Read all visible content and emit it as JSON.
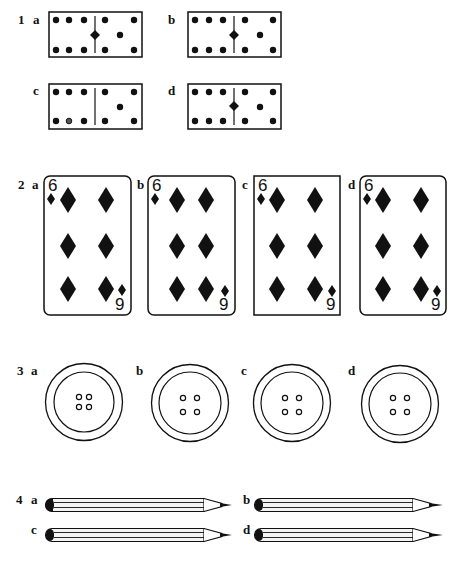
{
  "page": {
    "type": "spot-the-odd-one-out exercise",
    "colors": {
      "ink": "#111111",
      "paper": "#ffffff",
      "pencil_body": "#f4f4f4"
    }
  },
  "questions": [
    {
      "number": "1",
      "subject": "dominoes",
      "options": [
        {
          "letter": "a",
          "left_pips": 6,
          "right_pips": 5,
          "center_diamond": true,
          "note": ""
        },
        {
          "letter": "b",
          "left_pips": 6,
          "right_pips": 5,
          "center_diamond": true,
          "note": ""
        },
        {
          "letter": "c",
          "left_pips": 6,
          "right_pips": 5,
          "center_diamond": false,
          "note": "one hollow-ish pip bottom-middle"
        },
        {
          "letter": "d",
          "left_pips": 6,
          "right_pips": 5,
          "center_diamond": true,
          "note": ""
        }
      ]
    },
    {
      "number": "2",
      "subject": "playing cards",
      "options": [
        {
          "letter": "a",
          "rank_top": "6",
          "rank_bottom": "9",
          "suit": "diamond",
          "corners": "rounded"
        },
        {
          "letter": "b",
          "rank_top": "6",
          "rank_bottom": "9",
          "suit": "diamond",
          "corners": "rounded"
        },
        {
          "letter": "c",
          "rank_top": "6",
          "rank_bottom": "9",
          "suit": "diamond",
          "corners": "square"
        },
        {
          "letter": "d",
          "rank_top": "6",
          "rank_bottom": "9",
          "suit": "diamond",
          "corners": "rounded"
        }
      ]
    },
    {
      "number": "3",
      "subject": "buttons",
      "options": [
        {
          "letter": "a",
          "holes": 4,
          "hole_spacing": "close"
        },
        {
          "letter": "b",
          "holes": 4,
          "hole_spacing": "wide"
        },
        {
          "letter": "c",
          "holes": 4,
          "hole_spacing": "wide"
        },
        {
          "letter": "d",
          "holes": 4,
          "hole_spacing": "wide"
        }
      ]
    },
    {
      "number": "4",
      "subject": "pencils",
      "options": [
        {
          "letter": "a"
        },
        {
          "letter": "b"
        },
        {
          "letter": "c"
        },
        {
          "letter": "d"
        }
      ]
    }
  ]
}
